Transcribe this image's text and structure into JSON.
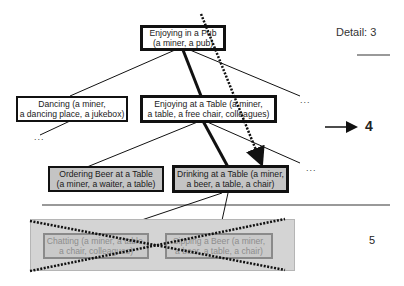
{
  "diagram": {
    "type": "activity-tree",
    "detail_label": "Detail: 3",
    "level_4_label": "4",
    "level_5_label": "5",
    "ellipsis": "...",
    "nodes": {
      "root": {
        "line1": "Enjoying in a Pub",
        "line2": "(a miner, a pub)"
      },
      "dancing": {
        "line1": "Dancing (a miner,",
        "line2": "a dancing place, a jukebox)"
      },
      "table": {
        "line1": "Enjoying at a Table (a miner,",
        "line2": "a table, a free chair, colleagues)"
      },
      "ordering": {
        "line1": "Ordering Beer at a Table",
        "line2": "(a miner, a waiter, a table)"
      },
      "drinking": {
        "line1": "Drinking at a Table (a miner,",
        "line2": "a beer, a table, a chair)"
      },
      "chatting": {
        "line1": "Chatting (a miner, a table,",
        "line2": "a chair, colleagues)"
      },
      "sipping": {
        "line1": "Sipping a Beer (a miner,",
        "line2": "a beer, a table, a chair)"
      }
    },
    "colors": {
      "edge": "#111111",
      "active_node_fill": "#c4c4c4",
      "pruned_fill": "#d4d4d4",
      "pruned_text": "#8d8d8d",
      "separator": "#777777"
    }
  }
}
